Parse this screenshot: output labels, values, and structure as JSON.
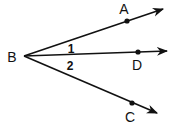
{
  "diagram": {
    "type": "geometry-angles",
    "vertex": {
      "label": "B",
      "x": 24,
      "y": 56
    },
    "rays": [
      {
        "name": "BA",
        "point_label": "A",
        "point": [
          127,
          21
        ],
        "end": [
          163,
          9
        ],
        "label_pos": [
          124,
          14
        ]
      },
      {
        "name": "BD",
        "point_label": "D",
        "point": [
          138,
          52
        ],
        "end": [
          167,
          51
        ],
        "label_pos": [
          137,
          70
        ]
      },
      {
        "name": "BC",
        "point_label": "C",
        "point": [
          132,
          103
        ],
        "end": [
          157,
          113
        ],
        "label_pos": [
          130,
          122
        ]
      }
    ],
    "angles": [
      {
        "label": "1",
        "between": [
          "BA",
          "BD"
        ],
        "label_pos": [
          71,
          53
        ]
      },
      {
        "label": "2",
        "between": [
          "BD",
          "BC"
        ],
        "label_pos": [
          70,
          70
        ]
      }
    ],
    "colors": {
      "stroke": "#111111",
      "background": "#ffffff"
    }
  }
}
